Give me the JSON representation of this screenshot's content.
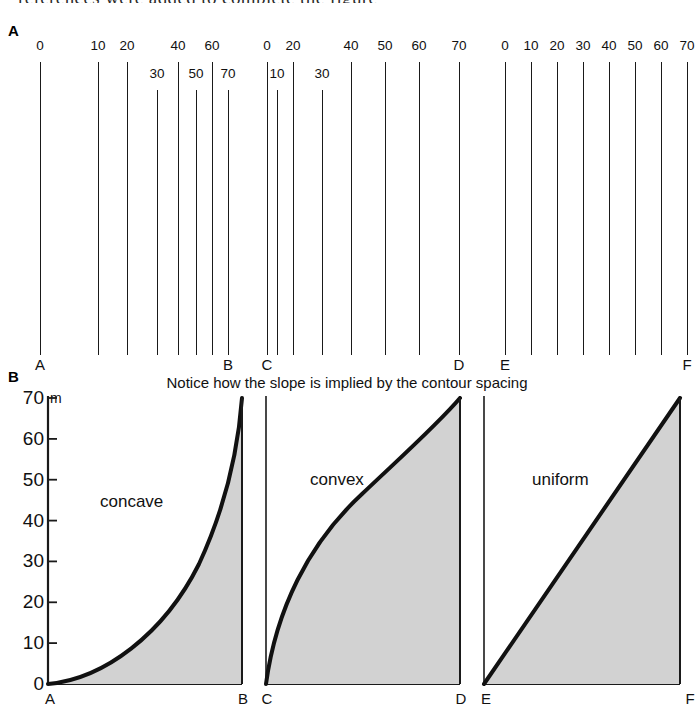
{
  "running_text": "references were added to complete the figure",
  "panels": {
    "a": {
      "letter": "A",
      "diagrams": [
        {
          "id": "ab",
          "start_label": "A",
          "end_label": "B",
          "slope_type": "concave",
          "contours": [
            {
              "value": "0",
              "x": 40,
              "row": 0
            },
            {
              "value": "10",
              "x": 98,
              "row": 0
            },
            {
              "value": "20",
              "x": 127,
              "row": 0
            },
            {
              "value": "30",
              "x": 157,
              "row": 1
            },
            {
              "value": "40",
              "x": 178,
              "row": 0
            },
            {
              "value": "50",
              "x": 196,
              "row": 1
            },
            {
              "value": "60",
              "x": 212,
              "row": 0
            },
            {
              "value": "70",
              "x": 228,
              "row": 1
            }
          ]
        },
        {
          "id": "cd",
          "start_label": "C",
          "end_label": "D",
          "slope_type": "convex",
          "contours": [
            {
              "value": "0",
              "x": 267,
              "row": 0
            },
            {
              "value": "10",
              "x": 277,
              "row": 1
            },
            {
              "value": "20",
              "x": 293,
              "row": 0
            },
            {
              "value": "30",
              "x": 322,
              "row": 1
            },
            {
              "value": "40",
              "x": 351,
              "row": 0
            },
            {
              "value": "50",
              "x": 385,
              "row": 0
            },
            {
              "value": "60",
              "x": 419,
              "row": 0
            },
            {
              "value": "70",
              "x": 459,
              "row": 0
            }
          ]
        },
        {
          "id": "ef",
          "start_label": "E",
          "end_label": "F",
          "slope_type": "uniform",
          "contours": [
            {
              "value": "0",
              "x": 505,
              "row": 0
            },
            {
              "value": "10",
              "x": 531,
              "row": 0
            },
            {
              "value": "20",
              "x": 557,
              "row": 0
            },
            {
              "value": "30",
              "x": 583,
              "row": 0
            },
            {
              "value": "40",
              "x": 609,
              "row": 0
            },
            {
              "value": "50",
              "x": 635,
              "row": 0
            },
            {
              "value": "60",
              "x": 661,
              "row": 0
            },
            {
              "value": "70",
              "x": 687,
              "row": 0
            }
          ]
        }
      ]
    },
    "b": {
      "letter": "B",
      "caption": "Notice how the slope is implied by the contour spacing",
      "unit": "m",
      "y_ticks": [
        "70",
        "60",
        "50",
        "40",
        "30",
        "20",
        "10",
        "0"
      ],
      "profiles": [
        {
          "id": "ab",
          "name": "concave",
          "start_label": "A",
          "end_label": "B"
        },
        {
          "id": "cd",
          "name": "convex",
          "start_label": "C",
          "end_label": "D"
        },
        {
          "id": "ef",
          "name": "uniform",
          "start_label": "E",
          "end_label": "F"
        }
      ]
    }
  },
  "colors": {
    "ink": "#1a1a1a",
    "fill": "#d2d2d2",
    "background": "#ffffff"
  },
  "chart_data": [
    {
      "type": "line",
      "id": "profile-concave",
      "title": "concave",
      "xlabel": "",
      "ylabel": "m",
      "ylim": [
        0,
        70
      ],
      "x": [
        0,
        10,
        20,
        30,
        40,
        50,
        60,
        70,
        80,
        90,
        100
      ],
      "values": [
        0,
        1.2,
        3.0,
        5.6,
        9.2,
        14.0,
        20.5,
        29.0,
        40.0,
        53.5,
        70
      ],
      "grid": false,
      "legend": "none",
      "annotations": [
        "A",
        "B"
      ]
    },
    {
      "type": "line",
      "id": "profile-convex",
      "title": "convex",
      "xlabel": "",
      "ylabel": "m",
      "ylim": [
        0,
        70
      ],
      "x": [
        0,
        10,
        20,
        30,
        40,
        50,
        60,
        70,
        80,
        90,
        100
      ],
      "values": [
        0,
        17.0,
        28.5,
        37.5,
        44.5,
        50.5,
        55.5,
        60.0,
        64.0,
        67.2,
        70
      ],
      "grid": false,
      "legend": "none",
      "annotations": [
        "C",
        "D"
      ]
    },
    {
      "type": "line",
      "id": "profile-uniform",
      "title": "uniform",
      "xlabel": "",
      "ylabel": "m",
      "ylim": [
        0,
        70
      ],
      "x": [
        0,
        10,
        20,
        30,
        40,
        50,
        60,
        70,
        80,
        90,
        100
      ],
      "values": [
        0,
        7,
        14,
        21,
        28,
        35,
        42,
        49,
        56,
        63,
        70
      ],
      "grid": false,
      "legend": "none",
      "annotations": [
        "E",
        "F"
      ]
    }
  ]
}
